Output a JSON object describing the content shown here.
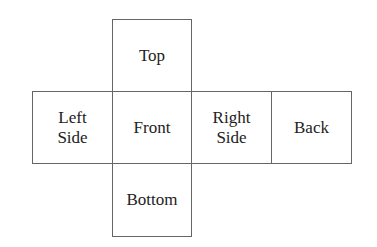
{
  "diagram": {
    "type": "cube-net",
    "faces": {
      "top": "Top",
      "left": "Left\nSide",
      "front": "Front",
      "right": "Right\nSide",
      "back": "Back",
      "bottom": "Bottom"
    }
  }
}
